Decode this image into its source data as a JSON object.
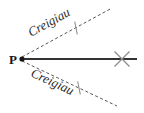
{
  "figure": {
    "type": "geometry-diagram",
    "background_color": "#ffffff",
    "width": 144,
    "height": 113
  },
  "points": {
    "origin": {
      "label": "P",
      "x": 22,
      "y": 59,
      "marker": "filled-dot",
      "color": "#161616"
    },
    "cross_mark": {
      "label": "",
      "x": 122,
      "y": 59,
      "marker": "x-cross",
      "color": "#8c8c8c"
    }
  },
  "lines": {
    "solid_ray": {
      "name": "baseline",
      "style": "solid",
      "color": "#333333",
      "width": 2,
      "x1": 22,
      "y1": 59,
      "x2": 137,
      "y2": 59
    },
    "upper_dashed_ray": {
      "name": "bearing-upper",
      "style": "dashed",
      "color": "#555555",
      "width": 1,
      "x1": 22,
      "y1": 57,
      "x2": 112,
      "y2": 8,
      "tick": {
        "x": 76,
        "y": 28,
        "length": 13
      }
    },
    "lower_dashed_ray": {
      "name": "bearing-lower",
      "style": "dashed",
      "color": "#555555",
      "width": 1,
      "x1": 22,
      "y1": 61,
      "x2": 117,
      "y2": 106,
      "tick": {
        "x": 79,
        "y": 88,
        "length": 13
      }
    }
  },
  "labels": {
    "upper": {
      "text": "Creigiau",
      "x": 31,
      "y": 37,
      "rotation": -29,
      "font_size": 13
    },
    "lower": {
      "text": "Creigiau",
      "x": 30,
      "y": 76,
      "rotation": 25,
      "font_size": 13
    },
    "point_p": {
      "text": "P",
      "x": 9,
      "y": 64,
      "font_size": 13
    }
  },
  "colors": {
    "ink": "#333333",
    "dash": "#555555",
    "mark": "#8c8c8c",
    "text": "#2b2b2b"
  }
}
